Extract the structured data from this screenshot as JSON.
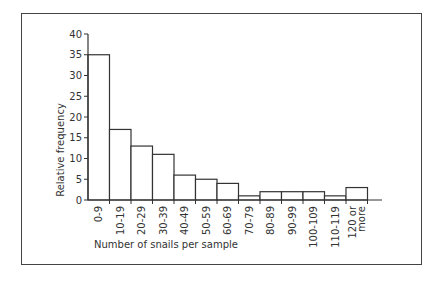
{
  "chart_data": {
    "type": "bar",
    "title": "",
    "xlabel": "Number of snails per sample",
    "ylabel": "Relative frequency",
    "ylim": [
      0,
      40
    ],
    "yticks": [
      0,
      5,
      10,
      15,
      20,
      25,
      30,
      35,
      40
    ],
    "grid": false,
    "categories": [
      "0-9",
      "10-19",
      "20-29",
      "30-39",
      "40-49",
      "50-59",
      "60-69",
      "70-79",
      "80-89",
      "90-99",
      "100-109",
      "110-119",
      "120 or more"
    ],
    "category_lines": [
      [
        "0-9"
      ],
      [
        "10-19"
      ],
      [
        "20-29"
      ],
      [
        "30-39"
      ],
      [
        "40-49"
      ],
      [
        "50-59"
      ],
      [
        "60-69"
      ],
      [
        "70-79"
      ],
      [
        "80-89"
      ],
      [
        "90-99"
      ],
      [
        "100-109"
      ],
      [
        "110-119"
      ],
      [
        "120 or",
        "more"
      ]
    ],
    "values": [
      35,
      17,
      13,
      11,
      6,
      5,
      4,
      1,
      2,
      2,
      2,
      1,
      3
    ]
  }
}
